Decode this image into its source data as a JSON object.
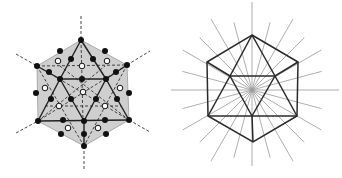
{
  "figures": [
    {
      "id": "left",
      "description": "Icosahedron projection along 3-fold axis with shaded hexagonal outline, symmetry axes dashed, black and white lattice points",
      "colors": {
        "fill": "#cfcfcf",
        "edge": "#222222",
        "dashed": "#333333",
        "dot_black": "#111111",
        "dot_white": "#ffffff"
      },
      "hexagon": [
        [
          81,
          40
        ],
        [
          127,
          65
        ],
        [
          129,
          120
        ],
        [
          84,
          146
        ],
        [
          38,
          121
        ],
        [
          37,
          66
        ]
      ],
      "solid_edges": [
        [
          [
            81,
            40
          ],
          [
            60,
            79
          ]
        ],
        [
          [
            81,
            40
          ],
          [
            106,
            79
          ]
        ],
        [
          [
            37,
            66
          ],
          [
            60,
            79
          ]
        ],
        [
          [
            127,
            65
          ],
          [
            106,
            79
          ]
        ],
        [
          [
            60,
            79
          ],
          [
            106,
            79
          ]
        ],
        [
          [
            60,
            79
          ],
          [
            38,
            121
          ]
        ],
        [
          [
            106,
            79
          ],
          [
            129,
            120
          ]
        ],
        [
          [
            60,
            79
          ],
          [
            84,
            121
          ]
        ],
        [
          [
            106,
            79
          ],
          [
            84,
            121
          ]
        ],
        [
          [
            38,
            121
          ],
          [
            129,
            120
          ]
        ],
        [
          [
            84,
            121
          ],
          [
            84,
            146
          ]
        ]
      ],
      "dashed_edges": [
        [
          [
            81,
            16
          ],
          [
            81,
            40
          ]
        ],
        [
          [
            84,
            146
          ],
          [
            84,
            170
          ]
        ],
        [
          [
            16,
            54
          ],
          [
            37,
            66
          ]
        ],
        [
          [
            127,
            65
          ],
          [
            150,
            51
          ]
        ],
        [
          [
            16,
            133
          ],
          [
            38,
            121
          ]
        ],
        [
          [
            129,
            120
          ],
          [
            150,
            132
          ]
        ],
        [
          [
            37,
            66
          ],
          [
            127,
            65
          ]
        ],
        [
          [
            81,
            40
          ],
          [
            83,
            121
          ]
        ],
        [
          [
            37,
            66
          ],
          [
            84,
            146
          ]
        ],
        [
          [
            127,
            65
          ],
          [
            84,
            146
          ]
        ],
        [
          [
            38,
            121
          ],
          [
            105,
            66
          ]
        ],
        [
          [
            129,
            120
          ],
          [
            60,
            66
          ]
        ],
        [
          [
            37,
            66
          ],
          [
            129,
            120
          ]
        ],
        [
          [
            127,
            65
          ],
          [
            38,
            121
          ]
        ],
        [
          [
            45,
            106
          ],
          [
            121,
            106
          ]
        ]
      ],
      "black_dots": [
        [
          81,
          40
        ],
        [
          37,
          66
        ],
        [
          127,
          65
        ],
        [
          38,
          121
        ],
        [
          129,
          120
        ],
        [
          84,
          146
        ],
        [
          60,
          51
        ],
        [
          105,
          51
        ],
        [
          71,
          59
        ],
        [
          93,
          59
        ],
        [
          49,
          72
        ],
        [
          116,
          72
        ],
        [
          60,
          79
        ],
        [
          106,
          79
        ],
        [
          82,
          79
        ],
        [
          36,
          93
        ],
        [
          129,
          93
        ],
        [
          51,
          99
        ],
        [
          71,
          99
        ],
        [
          96,
          99
        ],
        [
          117,
          99
        ],
        [
          63,
          120
        ],
        [
          84,
          121
        ],
        [
          105,
          120
        ],
        [
          61,
          134
        ],
        [
          84,
          134
        ],
        [
          106,
          134
        ]
      ],
      "white_dots": [
        [
          58,
          61
        ],
        [
          82,
          66
        ],
        [
          107,
          61
        ],
        [
          45,
          88
        ],
        [
          83,
          92
        ],
        [
          120,
          88
        ],
        [
          59,
          106
        ],
        [
          105,
          106
        ],
        [
          68,
          128
        ],
        [
          98,
          128
        ]
      ]
    },
    {
      "id": "right",
      "description": "Same icosahedron outline in wireframe with radial axes through centre",
      "colors": {
        "edge": "#2a2a2a",
        "ray": "#9a9a9a"
      },
      "center": [
        81,
        90
      ],
      "hexagon": [
        [
          81,
          35
        ],
        [
          127,
          62
        ],
        [
          126,
          116
        ],
        [
          82,
          142
        ],
        [
          37,
          116
        ],
        [
          36,
          62
        ]
      ],
      "solid_edges": [
        [
          [
            81,
            35
          ],
          [
            59,
            76
          ]
        ],
        [
          [
            81,
            35
          ],
          [
            104,
            76
          ]
        ],
        [
          [
            36,
            62
          ],
          [
            59,
            76
          ]
        ],
        [
          [
            127,
            62
          ],
          [
            104,
            76
          ]
        ],
        [
          [
            59,
            76
          ],
          [
            104,
            76
          ]
        ],
        [
          [
            59,
            76
          ],
          [
            37,
            116
          ]
        ],
        [
          [
            104,
            76
          ],
          [
            126,
            116
          ]
        ],
        [
          [
            59,
            76
          ],
          [
            81,
            116
          ]
        ],
        [
          [
            104,
            76
          ],
          [
            81,
            116
          ]
        ],
        [
          [
            37,
            116
          ],
          [
            126,
            116
          ]
        ],
        [
          [
            81,
            116
          ],
          [
            82,
            142
          ]
        ]
      ],
      "rays": {
        "count": 24,
        "angles_deg": [
          0,
          15,
          30,
          45,
          60,
          75,
          90,
          105,
          120,
          135,
          150,
          165,
          180,
          195,
          210,
          225,
          240,
          255,
          270,
          285,
          300,
          315,
          330,
          345
        ],
        "lengths": [
          87,
          72,
          80,
          74,
          82,
          70,
          88,
          70,
          82,
          74,
          80,
          72,
          87,
          72,
          80,
          74,
          82,
          70,
          76,
          70,
          82,
          74,
          80,
          72
        ]
      }
    }
  ]
}
